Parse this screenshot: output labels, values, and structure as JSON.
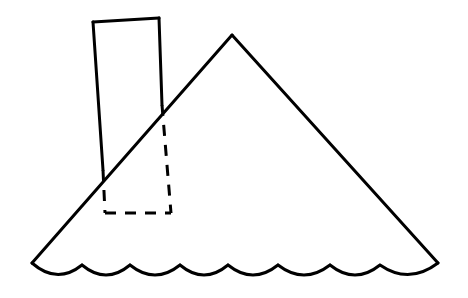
{
  "figure": {
    "background_color": "#ffffff",
    "stroke_color": "#000000",
    "stroke_width": 3,
    "dash_pattern": "11 9",
    "canvas": {
      "width": 468,
      "height": 298
    },
    "shapes": {
      "mountain": {
        "name": "mountain-triangle",
        "style": "solid",
        "apex": {
          "x": 232,
          "y": 35
        },
        "base_left": {
          "x": 32,
          "y": 263
        },
        "base_right": {
          "x": 438,
          "y": 263
        },
        "left_slope_path": "M 32 263 L 232 35",
        "right_slope_path": "M 232 35 L 438 263"
      },
      "scalloped_base": {
        "name": "scalloped-ground-line",
        "style": "solid",
        "start": {
          "x": 32,
          "y": 263
        },
        "end": {
          "x": 438,
          "y": 263
        },
        "arc_count": 8,
        "arc_peaks_x": [
          82,
          130,
          180,
          228,
          278,
          330,
          380
        ],
        "arc_dip_y": 280,
        "path": "M 32 263 Q 57 285 82 265 Q 106 285 130 265 Q 155 285 180 265 Q 204 285 228 265 Q 253 285 278 265 Q 304 285 330 265 Q 355 285 380 265 Q 409 285 438 263"
      },
      "post_rectangle": {
        "name": "tilted-post-rectangle",
        "corners": {
          "top_left": {
            "x": 93,
            "y": 22
          },
          "top_right": {
            "x": 159,
            "y": 18
          },
          "bottom_right": {
            "x": 171,
            "y": 213
          },
          "bottom_left": {
            "x": 105,
            "y": 213
          }
        },
        "intersections": {
          "right_edge_with_slope": {
            "x": 162,
            "y": 105
          },
          "left_edge_with_slope": {
            "x": 103,
            "y": 170
          }
        },
        "segments": [
          {
            "name": "top-edge",
            "style": "solid",
            "path": "M 93 22 L 159 18"
          },
          {
            "name": "right-edge-visible",
            "style": "solid",
            "path": "M 159 18 L 162 105"
          },
          {
            "name": "right-edge-hidden",
            "style": "dashed",
            "path": "M 162 105 L 171 213"
          },
          {
            "name": "left-edge-visible",
            "style": "solid",
            "path": "M 93 22 L 103 170"
          },
          {
            "name": "left-edge-hidden",
            "style": "dashed",
            "path": "M 103 170 L 105 213"
          },
          {
            "name": "bottom-edge-hidden",
            "style": "dashed",
            "path": "M 105 213 L 171 213"
          }
        ]
      }
    }
  }
}
